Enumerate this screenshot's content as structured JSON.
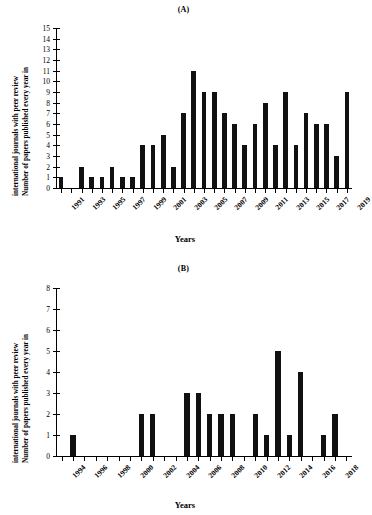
{
  "figure": {
    "background": "#ffffff",
    "bar_color": "#111111",
    "axis_color": "#000000"
  },
  "panels": [
    {
      "key": "A",
      "title": "(A)",
      "ylabel_line1": "Number of papers published  every year in",
      "ylabel_line2": "international  journals  with  peer review",
      "xlabel": "Years"
    },
    {
      "key": "B",
      "title": "(B)",
      "ylabel_line1": "Number of papers published  every year in",
      "ylabel_line2": "international  journals  with  peer review",
      "xlabel": "Years"
    }
  ],
  "chart_data": [
    {
      "type": "bar",
      "panel": "(A)",
      "title": "(A)",
      "xlabel": "Years",
      "ylabel": "Number of papers published every year in international journals with peer review",
      "ylim": [
        0,
        15
      ],
      "ytick_labels": [
        "0",
        "1",
        "2",
        "3",
        "4",
        "5",
        "6",
        "7",
        "8",
        "9",
        "10",
        "11",
        "12",
        "13",
        "14",
        "15"
      ],
      "ytick_values": [
        0,
        1,
        2,
        3,
        4,
        5,
        6,
        7,
        8,
        9,
        10,
        11,
        12,
        13,
        14,
        15
      ],
      "grid": false,
      "legend": "none",
      "categories": [
        "1991",
        "1992",
        "1993",
        "1994",
        "1995",
        "1996",
        "1997",
        "1998",
        "1999",
        "2000",
        "2001",
        "2002",
        "2003",
        "2004",
        "2005",
        "2006",
        "2007",
        "2008",
        "2009",
        "2010",
        "2011",
        "2012",
        "2013",
        "2014",
        "2015",
        "2016",
        "2017",
        "2018",
        "2019"
      ],
      "values": [
        1,
        0,
        2,
        1,
        1,
        2,
        1,
        1,
        4,
        4,
        5,
        2,
        7,
        11,
        9,
        9,
        7,
        6,
        4,
        6,
        8,
        4,
        9,
        4,
        7,
        6,
        6,
        3,
        9
      ],
      "xtick_labels_shown": [
        "1991",
        "1993",
        "1995",
        "1997",
        "1999",
        "2001",
        "2003",
        "2005",
        "2007",
        "2009",
        "2011",
        "2013",
        "2015",
        "2017",
        "2019"
      ]
    },
    {
      "type": "bar",
      "panel": "(B)",
      "title": "(B)",
      "xlabel": "Years",
      "ylabel": "Number of papers published every year in international journals with peer review",
      "ylim": [
        0,
        8
      ],
      "ytick_labels": [
        "0",
        "1",
        "2",
        "3",
        "4",
        "5",
        "6",
        "7",
        "8"
      ],
      "ytick_values": [
        0,
        1,
        2,
        3,
        4,
        5,
        6,
        7,
        8
      ],
      "grid": false,
      "legend": "none",
      "categories": [
        "1994",
        "1995",
        "1996",
        "1997",
        "1998",
        "1999",
        "2000",
        "2001",
        "2002",
        "2003",
        "2004",
        "2005",
        "2006",
        "2007",
        "2008",
        "2009",
        "2010",
        "2011",
        "2012",
        "2013",
        "2014",
        "2015",
        "2016",
        "2017",
        "2018",
        "2019"
      ],
      "values": [
        0,
        1,
        0,
        0,
        0,
        0,
        0,
        2,
        2,
        0,
        0,
        3,
        3,
        2,
        2,
        2,
        0,
        2,
        1,
        5,
        1,
        4,
        0,
        1,
        2,
        0
      ],
      "xtick_labels_shown": [
        "1994",
        "1996",
        "1998",
        "2000",
        "2002",
        "2004",
        "2006",
        "2008",
        "2010",
        "2012",
        "2014",
        "2016",
        "2018"
      ]
    }
  ]
}
